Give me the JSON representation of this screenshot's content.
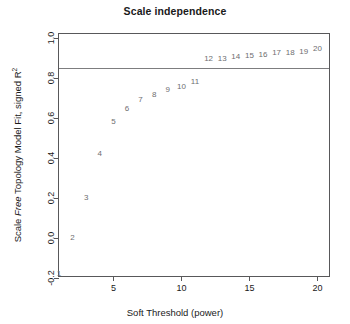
{
  "chart_data": {
    "type": "scatter",
    "title": "Scale independence",
    "xlabel": "Soft Threshold (power)",
    "ylabel_parts": {
      "pre": "Scale ",
      "italic": "Free",
      "post": " Topology Model Fit, signed R",
      "sup": "2"
    },
    "ylabel": "Scale Free Topology Model Fit, signed R2",
    "xlim": [
      1,
      21
    ],
    "ylim": [
      -0.2,
      1.02
    ],
    "xticks": [
      5,
      10,
      15,
      20
    ],
    "yticks": [
      -0.2,
      0.0,
      0.2,
      0.4,
      0.6,
      0.8,
      1.0
    ],
    "ytick_labels": [
      "-0.2",
      "0.0",
      "0.2",
      "0.4",
      "0.6",
      "0.8",
      "1.0"
    ],
    "grid": false,
    "legend": "none",
    "point_render": "text-labels",
    "hline": {
      "value": 0.85,
      "color": "#7d7d7f",
      "label": ""
    },
    "x": [
      1,
      2,
      3,
      4,
      5,
      6,
      7,
      8,
      9,
      10,
      11,
      12,
      13,
      14,
      15,
      16,
      17,
      18,
      19,
      20
    ],
    "values": [
      -0.18,
      0.0,
      0.2,
      0.42,
      0.58,
      0.645,
      0.69,
      0.715,
      0.74,
      0.755,
      0.78,
      0.895,
      0.895,
      0.905,
      0.91,
      0.915,
      0.925,
      0.925,
      0.93,
      0.945
    ],
    "point_labels": [
      "1",
      "2",
      "3",
      "4",
      "5",
      "6",
      "7",
      "8",
      "9",
      "10",
      "11",
      "12",
      "13",
      "14",
      "15",
      "16",
      "17",
      "18",
      "19",
      "20"
    ]
  },
  "colors": {
    "text": "#1a1a1a",
    "point": "#6e6e70",
    "axis": "#58585a",
    "hline": "#7d7d7f",
    "background": "#ffffff"
  }
}
